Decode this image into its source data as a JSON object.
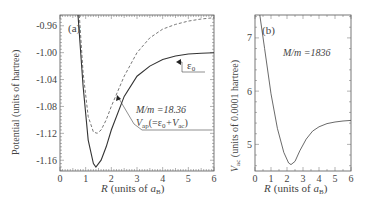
{
  "chart_data": [
    {
      "type": "line",
      "panel_label": "(a)",
      "title": "",
      "xlabel": "R (units of a_B)",
      "ylabel": "Potential (units of hartree)",
      "xlim": [
        0,
        6
      ],
      "ylim": [
        -1.176,
        -0.944
      ],
      "xticks": [
        "0",
        "1",
        "2",
        "3",
        "4",
        "5",
        "6"
      ],
      "yticks": [
        "-0.96",
        "-1.00",
        "-1.04",
        "-1.08",
        "-1.12",
        "-1.16"
      ],
      "annotations": [
        "M/m =18.36",
        "V_ap(=ε0+V_ac)",
        "ε0"
      ],
      "series": [
        {
          "name": "ε0",
          "style": "solid",
          "x": [
            0.7,
            0.9,
            1.1,
            1.3,
            1.4,
            1.6,
            1.8,
            2.0,
            2.5,
            3.0,
            3.5,
            4.0,
            4.5,
            5.0,
            5.5,
            6.0
          ],
          "y": [
            -0.94,
            -1.05,
            -1.13,
            -1.165,
            -1.17,
            -1.16,
            -1.14,
            -1.115,
            -1.065,
            -1.035,
            -1.02,
            -1.01,
            -1.005,
            -1.002,
            -1.001,
            -1.0
          ]
        },
        {
          "name": "V_ap (=ε0+V_ac)",
          "style": "dashed",
          "x": [
            0.75,
            0.9,
            1.1,
            1.3,
            1.45,
            1.6,
            1.8,
            2.0,
            2.5,
            3.0,
            3.5,
            4.0,
            4.5,
            5.0,
            5.5,
            6.0
          ],
          "y": [
            -0.94,
            -1.03,
            -1.095,
            -1.118,
            -1.12,
            -1.115,
            -1.1,
            -1.08,
            -1.035,
            -1.0,
            -0.978,
            -0.965,
            -0.958,
            -0.953,
            -0.95,
            -0.948
          ]
        }
      ]
    },
    {
      "type": "line",
      "panel_label": "(b)",
      "title": "",
      "xlabel": "R (units of a_B)",
      "ylabel": "V_ac (units of 0.0001 hartree)",
      "xlim": [
        0,
        6
      ],
      "ylim": [
        4.5,
        7.43
      ],
      "xticks": [
        "0",
        "1",
        "2",
        "3",
        "4",
        "5",
        "6"
      ],
      "yticks": [
        "5",
        "6",
        "7"
      ],
      "annotations": [
        "M/m =1836"
      ],
      "series": [
        {
          "name": "V_ac",
          "style": "solid",
          "x": [
            0.3,
            0.6,
            1.0,
            1.4,
            1.8,
            2.1,
            2.25,
            2.5,
            2.8,
            3.2,
            3.6,
            4.0,
            4.5,
            5.0,
            5.5,
            6.0
          ],
          "y": [
            7.43,
            6.8,
            5.95,
            5.3,
            4.85,
            4.65,
            4.62,
            4.68,
            4.88,
            5.1,
            5.25,
            5.33,
            5.39,
            5.42,
            5.44,
            5.45
          ]
        }
      ]
    }
  ],
  "labels": {
    "a": {
      "panel": "(a)",
      "ylabel": "Potential (units of hartree)",
      "xlabel_R": "R",
      "xlabel_units": "(units of ",
      "xlabel_a": "a",
      "xlabel_B": "B",
      "xlabel_close": ")",
      "mm": "M/m =18.36",
      "vap_V": "V",
      "vap_sub": "ap",
      "vap_rest1": "(=ε",
      "vap_0": "0",
      "vap_rest2": "+V",
      "vap_ac": "ac",
      "vap_close": ")",
      "eps": "ε",
      "eps_sub": "0"
    },
    "b": {
      "panel": "(b)",
      "ylabel_V": "V",
      "ylabel_sub": "ac",
      "ylabel_rest": " (units of  0.0001 hartree)",
      "mm": "M/m =1836",
      "xlabel_R": "R",
      "xlabel_units": "(units of ",
      "xlabel_a": "a",
      "xlabel_B": "B",
      "xlabel_close": ")"
    }
  },
  "colors": {
    "axis": "#555555",
    "curve": "#333333",
    "text": "#444444"
  }
}
